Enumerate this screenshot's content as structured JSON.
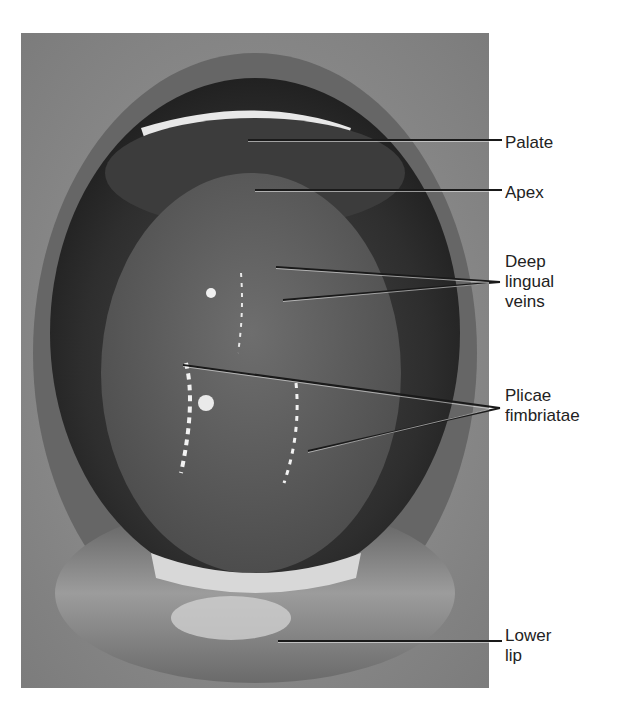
{
  "figure": {
    "colors": {
      "label_text": "#222222",
      "leader_line": "#1a1a1a",
      "photo_mid": "#8a8a8a"
    },
    "labels": [
      {
        "id": "palate",
        "lines": [
          "Palate"
        ],
        "top": 133,
        "points": [
          [
            248,
            140
          ]
        ],
        "anchor": [
          502,
          140
        ]
      },
      {
        "id": "apex",
        "lines": [
          "Apex"
        ],
        "top": 183,
        "points": [
          [
            255,
            190
          ]
        ],
        "anchor": [
          502,
          190
        ]
      },
      {
        "id": "deep-lingual-veins",
        "lines": [
          "Deep",
          "lingual",
          "veins"
        ],
        "top": 252,
        "points": [
          [
            276,
            267
          ],
          [
            283,
            300
          ]
        ],
        "anchor": [
          500,
          282
        ]
      },
      {
        "id": "plicae-fimbriatae",
        "lines": [
          "Plicae",
          "fimbriatae"
        ],
        "top": 386,
        "points": [
          [
            183,
            365
          ],
          [
            308,
            451
          ]
        ],
        "anchor": [
          500,
          408
        ]
      },
      {
        "id": "lower-lip",
        "lines": [
          "Lower",
          "lip"
        ],
        "top": 626,
        "points": [
          [
            278,
            641
          ]
        ],
        "anchor": [
          502,
          641
        ]
      }
    ]
  }
}
